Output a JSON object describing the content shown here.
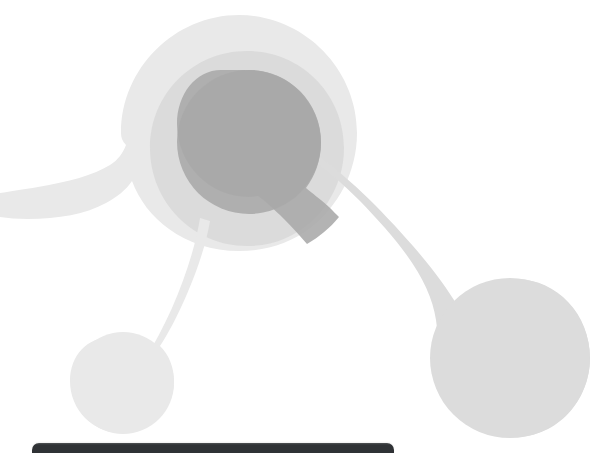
{
  "canvas": {
    "width": 593,
    "height": 453,
    "background_color": "#ffffff",
    "title": "Abstract molecular network graphic"
  },
  "palette": {
    "blob_light": "#e9e9e9",
    "blob_mid": "#d6d6d6",
    "blob_dark": "#a9a9a9",
    "blob_darkest": "#9d9d9d",
    "device_bar": "#2f3235",
    "device_bar_highlight": "#4a4d50",
    "background": "#ffffff"
  },
  "artwork": {
    "name": "network-node-graphic",
    "description": "Three overlapping translucent grey organic blobs forming a node-and-link molecule shape",
    "layers": [
      {
        "id": "layer-outer-halo",
        "name": "outer-halo-blob",
        "fill": "#e9e9e9",
        "opacity": 1,
        "note": "Large pale circle centred upper-middle with a tendril reaching the left edge"
      },
      {
        "id": "layer-mid-lobe",
        "name": "mid-lobe-blob",
        "fill": "#d6d6d6",
        "opacity": 0.72,
        "note": "Mid grey rounded lobe overlapping the halo, tapering down-right toward the large bottom-right node"
      },
      {
        "id": "layer-core-node",
        "name": "core-node-blob",
        "fill": "#a9a9a9",
        "opacity": 0.85,
        "note": "Darkest inner circle at the centre of the composition"
      },
      {
        "id": "layer-lower-left-node",
        "name": "lower-left-node-blob",
        "fill": "#e9e9e9",
        "opacity": 1,
        "note": "Small pale teardrop node bottom-left connected by a thin stem"
      },
      {
        "id": "layer-lower-right-node",
        "name": "lower-right-node-blob",
        "fill": "#dcdcdc",
        "opacity": 1,
        "note": "Large pale teardrop node bottom-right connected by a thick tapering link"
      }
    ],
    "nodes": [
      {
        "name": "core-node",
        "cx": 249,
        "cy": 142,
        "r": 72
      },
      {
        "name": "halo-node",
        "cx": 239,
        "cy": 133,
        "r": 118
      },
      {
        "name": "mid-node",
        "cx": 247,
        "cy": 148,
        "r": 97
      },
      {
        "name": "lower-left-node",
        "cx": 123,
        "cy": 383,
        "r": 51
      },
      {
        "name": "lower-right-node",
        "cx": 510,
        "cy": 358,
        "r": 80
      }
    ],
    "links": [
      {
        "name": "link-left-edge",
        "from": "halo-node",
        "to": "left-edge"
      },
      {
        "name": "link-lower-left",
        "from": "mid-node",
        "to": "lower-left-node"
      },
      {
        "name": "link-lower-right",
        "from": "core-node",
        "to": "lower-right-node"
      }
    ]
  },
  "device_bar": {
    "name": "device-top-edge-bar",
    "x": 32,
    "y": 443,
    "width": 362,
    "height": 10,
    "color": "#2f3235",
    "corner_radius": 7
  }
}
